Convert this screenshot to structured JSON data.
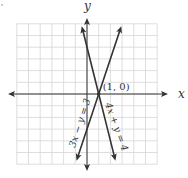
{
  "chart_data": {
    "type": "line",
    "title": "",
    "xlabel": "x",
    "ylabel": "y",
    "xlim": [
      -6,
      6
    ],
    "ylim": [
      -6,
      6
    ],
    "grid": true,
    "grid_step": 1,
    "series": [
      {
        "name": "3x − y = 3",
        "equation": {
          "a": 3,
          "b": -1,
          "c": 3
        },
        "x": [
          -0.9,
          2.93
        ],
        "y": [
          -5.7,
          5.8
        ],
        "color": "#333333"
      },
      {
        "name": "4x + y = 4",
        "equation": {
          "a": 4,
          "b": 1,
          "c": 4
        },
        "x": [
          -0.45,
          2.43
        ],
        "y": [
          5.8,
          -5.7
        ],
        "color": "#333333"
      }
    ],
    "annotations": [
      {
        "text": "(1, 0)",
        "x": 1,
        "y": 0
      }
    ]
  },
  "colors": {
    "grid": "#d6d6d6",
    "axis": "#333333",
    "line": "#333333"
  }
}
